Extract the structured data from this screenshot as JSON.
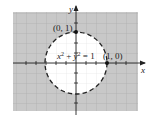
{
  "diagram": {
    "equation": "x² + y² = 1",
    "equation_parts": {
      "x": "x",
      "sup1": "2",
      "plus": " + ",
      "y": "y",
      "sup2": "2",
      "eq": " = 1"
    },
    "points": [
      {
        "label": "(0, 1)",
        "x": 0,
        "y": 1
      },
      {
        "label": "(1, 0)",
        "x": 1,
        "y": 0
      }
    ],
    "axes": {
      "x_label": "x",
      "y_label": "y"
    },
    "shading": "outside circle (region x² + y² ≥ 1)",
    "boundary": "dashed",
    "colors": {
      "shade": "#c8c8c8",
      "grid": "#a8a8a8",
      "axis": "#222222",
      "circle": "#222222",
      "inside": "#ffffff"
    }
  }
}
